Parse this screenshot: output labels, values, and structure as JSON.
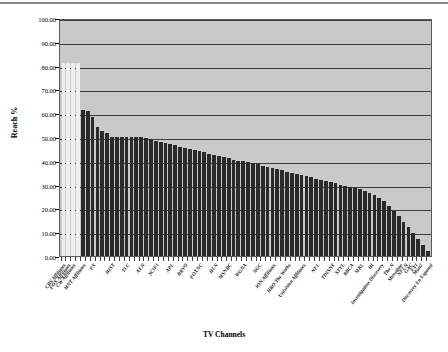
{
  "chart_data": {
    "type": "bar",
    "title": "",
    "xlabel": "TV Channels",
    "ylabel": "Reach %",
    "ylim": [
      0,
      100
    ],
    "ytick_labels": [
      "100.00",
      "90.00",
      "80.00",
      "70.00",
      "60.00",
      "50.00",
      "40.00",
      "30.00",
      "20.00",
      "10.00",
      "0.00"
    ],
    "ytick_values": [
      100,
      90,
      80,
      70,
      60,
      50,
      40,
      30,
      20,
      10,
      0
    ],
    "grid": true,
    "legend": "none",
    "plot_background": "#c9c9c9",
    "bar_color": "#2a2a2a",
    "highlight_bar_color": "#efefef",
    "categories": [
      "CBS Affiliates",
      "FOX Affiliates",
      "CW Affiliates",
      "MNT Affiliates",
      "FX",
      "HIST",
      "TLC",
      "AEN",
      "SCIFI",
      "APL",
      "BRVO",
      "FOXNC",
      "HLN",
      "MSNBC",
      "WGNA",
      "NGC",
      "ION Affiliates",
      "HBO The Works",
      "Univision Affiliates",
      "NFL",
      "TDISNY",
      "STYL",
      "BBCA",
      "MBL",
      "HI",
      "Investigation Discovery",
      "The N",
      "Showtime",
      "NFLN",
      "GAC",
      "FYI",
      "Mun2",
      "Discovery En Espanol"
    ],
    "values": [
      81.0,
      81.0,
      81.0,
      81.0,
      61.5,
      61.0,
      58.5,
      54.0,
      52.0,
      50.0,
      50.0,
      50.0,
      50.0,
      49.5,
      48.0,
      47.0,
      46.0,
      45.0,
      44.0,
      43.5,
      42.5,
      41.5,
      40.5,
      39.5,
      38.5,
      37.5,
      36.0,
      34.0,
      32.0,
      30.0,
      28.0,
      26.0,
      24.0
    ],
    "highlight_indices": [
      0,
      1,
      2,
      3
    ]
  },
  "bars_rendered": {
    "count": 76,
    "values": [
      81.0,
      81.0,
      81.0,
      81.0,
      61.5,
      61.0,
      58.5,
      54.0,
      52.5,
      51.5,
      50.0,
      50.0,
      50.0,
      50.0,
      50.0,
      50.0,
      50.0,
      49.5,
      49.0,
      48.5,
      48.0,
      47.5,
      47.0,
      46.5,
      46.0,
      45.5,
      45.0,
      44.5,
      44.0,
      43.5,
      43.0,
      42.5,
      42.0,
      41.5,
      41.0,
      40.5,
      40.0,
      40.0,
      39.5,
      39.0,
      38.5,
      38.0,
      37.5,
      37.0,
      36.5,
      36.0,
      35.5,
      35.0,
      34.5,
      34.0,
      33.5,
      33.0,
      32.5,
      32.0,
      31.5,
      31.0,
      30.5,
      30.0,
      29.5,
      29.0,
      28.5,
      28.0,
      27.5,
      26.5,
      25.5,
      24.5,
      23.0,
      21.0,
      19.0,
      17.0,
      14.5,
      12.0,
      9.5,
      7.0,
      4.5,
      2.0
    ],
    "light_count": 4
  },
  "label_positions": [
    0,
    1,
    2,
    4,
    6,
    10,
    13,
    16,
    19,
    22,
    25,
    28,
    31,
    34,
    37,
    40,
    43,
    46,
    49,
    52,
    55,
    57,
    59,
    61,
    63,
    65,
    67,
    69,
    70,
    71,
    72,
    73,
    75
  ]
}
